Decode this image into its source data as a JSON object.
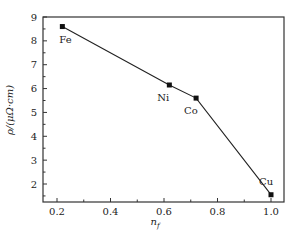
{
  "chart_data": {
    "type": "line",
    "title": "",
    "xlabel": "n_f",
    "ylabel": "ρ/(μΩ·cm)",
    "xlim": [
      0.15,
      1.03
    ],
    "ylim": [
      1.25,
      9
    ],
    "x_ticks": [
      "0.2",
      "0.4",
      "0.6",
      "0.8",
      "1.0"
    ],
    "y_ticks": [
      "2",
      "3",
      "4",
      "5",
      "6",
      "7",
      "8",
      "9"
    ],
    "grid": false,
    "legend": null,
    "series": [
      {
        "name": "resistivity",
        "marker": "square",
        "points": [
          {
            "label": "Fe",
            "x": 0.22,
            "y": 8.6
          },
          {
            "label": "Ni",
            "x": 0.62,
            "y": 6.15
          },
          {
            "label": "Co",
            "x": 0.72,
            "y": 5.6
          },
          {
            "label": "Cu",
            "x": 1.0,
            "y": 1.55
          }
        ]
      }
    ]
  },
  "labels": {
    "xlabel_main": "n",
    "xlabel_sub": "f",
    "ylabel": "ρ/(μΩ·cm)"
  }
}
